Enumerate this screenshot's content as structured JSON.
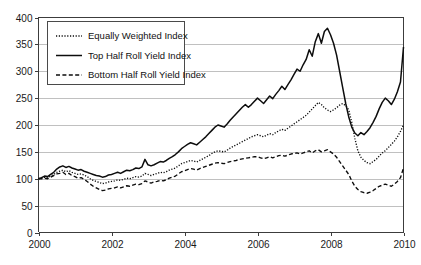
{
  "chart_data": {
    "type": "line",
    "title": "",
    "subtitle": "",
    "xlabel": "",
    "ylabel": "",
    "xlim": [
      2000,
      2010
    ],
    "ylim": [
      0,
      400
    ],
    "grid": true,
    "legend_position": "top-left",
    "y_ticks": [
      "0",
      "50",
      "100",
      "150",
      "200",
      "250",
      "300",
      "350",
      "400"
    ],
    "y_tick_values": [
      0,
      50,
      100,
      150,
      200,
      250,
      300,
      350,
      400
    ],
    "x_ticks": [
      "2000",
      "2002",
      "2004",
      "2006",
      "2008",
      "2010"
    ],
    "x_tick_values": [
      2000,
      2002,
      2004,
      2006,
      2008,
      2010
    ],
    "x": [
      2000.0,
      2000.083,
      2000.167,
      2000.25,
      2000.333,
      2000.417,
      2000.5,
      2000.583,
      2000.667,
      2000.75,
      2000.833,
      2000.917,
      2001.0,
      2001.083,
      2001.167,
      2001.25,
      2001.333,
      2001.417,
      2001.5,
      2001.583,
      2001.667,
      2001.75,
      2001.833,
      2001.917,
      2002.0,
      2002.083,
      2002.167,
      2002.25,
      2002.333,
      2002.417,
      2002.5,
      2002.583,
      2002.667,
      2002.75,
      2002.833,
      2002.917,
      2003.0,
      2003.083,
      2003.167,
      2003.25,
      2003.333,
      2003.417,
      2003.5,
      2003.583,
      2003.667,
      2003.75,
      2003.833,
      2003.917,
      2004.0,
      2004.083,
      2004.167,
      2004.25,
      2004.333,
      2004.417,
      2004.5,
      2004.583,
      2004.667,
      2004.75,
      2004.833,
      2004.917,
      2005.0,
      2005.083,
      2005.167,
      2005.25,
      2005.333,
      2005.417,
      2005.5,
      2005.583,
      2005.667,
      2005.75,
      2005.833,
      2005.917,
      2006.0,
      2006.083,
      2006.167,
      2006.25,
      2006.333,
      2006.417,
      2006.5,
      2006.583,
      2006.667,
      2006.75,
      2006.833,
      2006.917,
      2007.0,
      2007.083,
      2007.167,
      2007.25,
      2007.333,
      2007.417,
      2007.5,
      2007.583,
      2007.667,
      2007.75,
      2007.833,
      2007.917,
      2008.0,
      2008.083,
      2008.167,
      2008.25,
      2008.333,
      2008.417,
      2008.5,
      2008.583,
      2008.667,
      2008.75,
      2008.833,
      2008.917,
      2009.0,
      2009.083,
      2009.167,
      2009.25,
      2009.333,
      2009.417,
      2009.5,
      2009.583,
      2009.667,
      2009.75,
      2009.833,
      2009.917,
      2010.0
    ],
    "series": [
      {
        "name": "Equally Weighted Index",
        "style": "dotted",
        "color": "#0d0d0d",
        "values": [
          100,
          101,
          103,
          102,
          105,
          108,
          112,
          114,
          116,
          113,
          115,
          112,
          110,
          108,
          109,
          107,
          104,
          100,
          97,
          95,
          93,
          91,
          92,
          94,
          95,
          96,
          98,
          97,
          99,
          101,
          100,
          102,
          104,
          103,
          105,
          110,
          108,
          106,
          108,
          110,
          112,
          111,
          113,
          116,
          118,
          120,
          124,
          128,
          130,
          132,
          134,
          133,
          131,
          134,
          137,
          140,
          143,
          147,
          150,
          152,
          151,
          150,
          153,
          157,
          160,
          163,
          166,
          169,
          172,
          175,
          178,
          180,
          182,
          180,
          178,
          181,
          184,
          182,
          186,
          189,
          192,
          190,
          194,
          198,
          202,
          206,
          210,
          214,
          218,
          224,
          230,
          236,
          242,
          238,
          232,
          228,
          225,
          228,
          232,
          237,
          240,
          236,
          228,
          205,
          175,
          152,
          140,
          134,
          130,
          128,
          132,
          136,
          142,
          148,
          152,
          158,
          164,
          170,
          178,
          188,
          200
        ]
      },
      {
        "name": "Top Half Roll Yield Index",
        "style": "solid",
        "color": "#0d0d0d",
        "values": [
          100,
          102,
          105,
          104,
          108,
          112,
          118,
          122,
          124,
          121,
          123,
          120,
          118,
          116,
          117,
          114,
          112,
          110,
          108,
          106,
          105,
          103,
          104,
          107,
          108,
          110,
          112,
          110,
          113,
          116,
          115,
          117,
          120,
          119,
          122,
          136,
          126,
          124,
          126,
          129,
          132,
          131,
          134,
          138,
          141,
          145,
          150,
          156,
          160,
          164,
          167,
          165,
          163,
          168,
          173,
          178,
          184,
          190,
          196,
          200,
          198,
          196,
          202,
          209,
          215,
          221,
          227,
          233,
          238,
          233,
          238,
          244,
          250,
          245,
          240,
          247,
          254,
          249,
          257,
          264,
          272,
          266,
          275,
          284,
          294,
          304,
          300,
          312,
          322,
          340,
          328,
          355,
          370,
          352,
          374,
          380,
          368,
          352,
          330,
          300,
          270,
          240,
          215,
          196,
          185,
          180,
          186,
          182,
          188,
          195,
          205,
          216,
          230,
          242,
          250,
          245,
          238,
          248,
          262,
          280,
          345
        ]
      },
      {
        "name": "Bottom Half Roll Yield Index",
        "style": "dashed",
        "color": "#0d0d0d",
        "values": [
          100,
          100,
          101,
          100,
          103,
          106,
          109,
          110,
          112,
          108,
          110,
          106,
          104,
          101,
          102,
          99,
          95,
          90,
          86,
          83,
          80,
          78,
          79,
          81,
          82,
          83,
          85,
          83,
          85,
          87,
          86,
          88,
          90,
          89,
          91,
          96,
          94,
          92,
          94,
          95,
          97,
          96,
          98,
          101,
          103,
          105,
          109,
          113,
          115,
          117,
          119,
          118,
          116,
          119,
          121,
          123,
          125,
          127,
          129,
          130,
          129,
          128,
          130,
          132,
          133,
          134,
          136,
          137,
          138,
          139,
          140,
          141,
          141,
          139,
          137,
          139,
          141,
          139,
          141,
          143,
          144,
          142,
          144,
          146,
          147,
          148,
          146,
          148,
          150,
          152,
          148,
          152,
          154,
          150,
          152,
          154,
          150,
          146,
          140,
          132,
          124,
          116,
          108,
          96,
          86,
          80,
          76,
          74,
          73,
          75,
          78,
          82,
          86,
          88,
          90,
          88,
          86,
          90,
          95,
          102,
          120
        ]
      }
    ]
  },
  "legend": {
    "items": [
      {
        "label": "Equally Weighted Index",
        "style": "dotted"
      },
      {
        "label": "Top Half Roll Yield Index",
        "style": "solid"
      },
      {
        "label": "Bottom Half Roll Yield Index",
        "style": "dashed"
      }
    ]
  }
}
